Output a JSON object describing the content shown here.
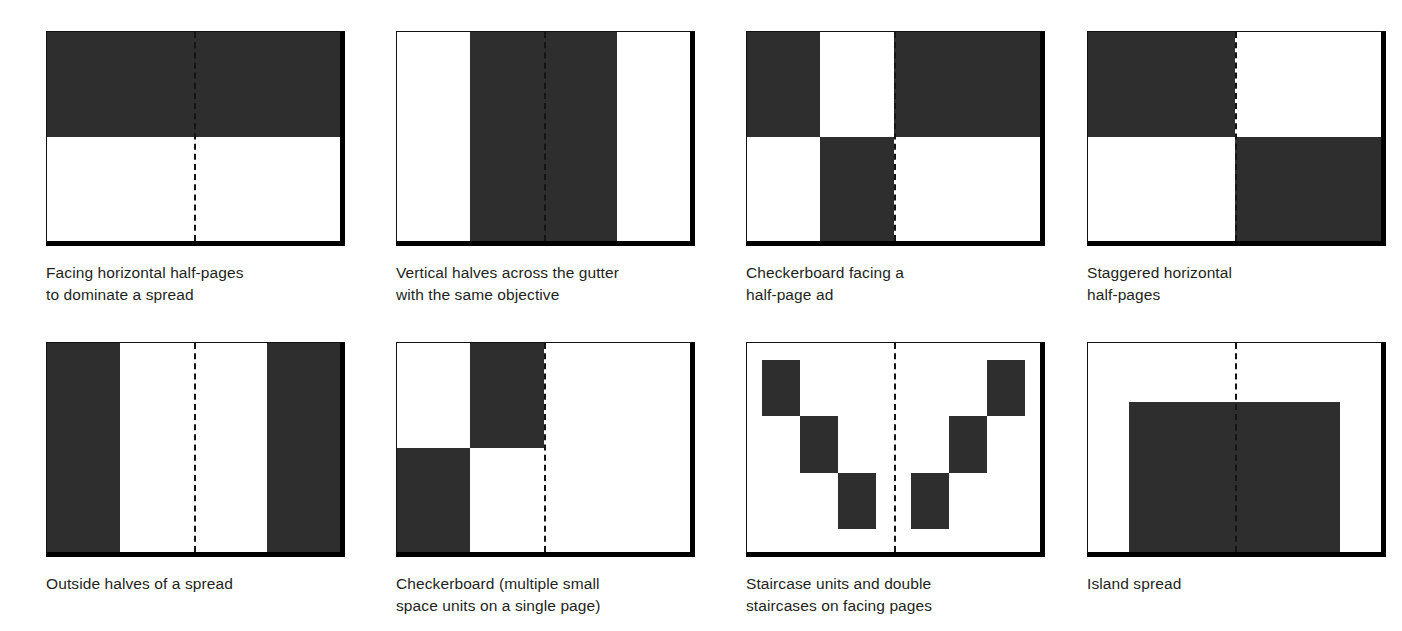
{
  "figure": {
    "fill_color": "#2e2e2e",
    "frame_color": "#000000",
    "page_color": "#ffffff",
    "caption_color": "#231f20"
  },
  "panels": [
    {
      "id": "facing-horizontal-half-pages",
      "caption": "Facing horizontal half-pages\nto dominate a spread",
      "frame": {
        "x": 46,
        "y": 31,
        "w": 299,
        "h": 215
      },
      "gutter_pct": 50,
      "blocks": [
        {
          "x_pct": 0,
          "y_pct": 0,
          "w_pct": 100,
          "h_pct": 50
        }
      ]
    },
    {
      "id": "vertical-halves-across-gutter",
      "caption": "Vertical halves across the gutter\nwith the same objective",
      "frame": {
        "x": 396,
        "y": 31,
        "w": 299,
        "h": 215
      },
      "gutter_pct": 50,
      "blocks": [
        {
          "x_pct": 25,
          "y_pct": 0,
          "w_pct": 50,
          "h_pct": 100
        }
      ]
    },
    {
      "id": "checkerboard-facing-half-page-ad",
      "caption": "Checkerboard facing a\nhalf-page ad",
      "frame": {
        "x": 746,
        "y": 31,
        "w": 299,
        "h": 215
      },
      "gutter_pct": 50,
      "blocks": [
        {
          "x_pct": 0,
          "y_pct": 0,
          "w_pct": 25,
          "h_pct": 50
        },
        {
          "x_pct": 25,
          "y_pct": 50,
          "w_pct": 25,
          "h_pct": 50
        },
        {
          "x_pct": 50,
          "y_pct": 0,
          "w_pct": 50,
          "h_pct": 50
        }
      ]
    },
    {
      "id": "staggered-horizontal-half-pages",
      "caption": "Staggered horizontal\nhalf-pages",
      "frame": {
        "x": 1087,
        "y": 31,
        "w": 299,
        "h": 215
      },
      "gutter_pct": 50,
      "blocks": [
        {
          "x_pct": 0,
          "y_pct": 0,
          "w_pct": 50,
          "h_pct": 50
        },
        {
          "x_pct": 50,
          "y_pct": 50,
          "w_pct": 50,
          "h_pct": 50
        }
      ]
    },
    {
      "id": "outside-halves-of-a-spread",
      "caption": "Outside halves of a spread",
      "frame": {
        "x": 46,
        "y": 342,
        "w": 299,
        "h": 215
      },
      "gutter_pct": 50,
      "blocks": [
        {
          "x_pct": 0,
          "y_pct": 0,
          "w_pct": 25,
          "h_pct": 100
        },
        {
          "x_pct": 75,
          "y_pct": 0,
          "w_pct": 25,
          "h_pct": 100
        }
      ]
    },
    {
      "id": "checkerboard-single-page",
      "caption": "Checkerboard (multiple small\nspace units on a single page)",
      "frame": {
        "x": 396,
        "y": 342,
        "w": 299,
        "h": 215
      },
      "gutter_pct": 50,
      "blocks": [
        {
          "x_pct": 25,
          "y_pct": 0,
          "w_pct": 25,
          "h_pct": 50
        },
        {
          "x_pct": 0,
          "y_pct": 50,
          "w_pct": 25,
          "h_pct": 50
        }
      ]
    },
    {
      "id": "staircase-units-double-staircases",
      "caption": "Staircase units and double\nstaircases on facing pages",
      "frame": {
        "x": 746,
        "y": 342,
        "w": 299,
        "h": 215
      },
      "gutter_pct": 50,
      "blocks": [
        {
          "x_pct": 5,
          "y_pct": 8,
          "w_pct": 13,
          "h_pct": 27
        },
        {
          "x_pct": 18,
          "y_pct": 35,
          "w_pct": 13,
          "h_pct": 27
        },
        {
          "x_pct": 31,
          "y_pct": 62,
          "w_pct": 13,
          "h_pct": 27
        },
        {
          "x_pct": 56,
          "y_pct": 62,
          "w_pct": 13,
          "h_pct": 27
        },
        {
          "x_pct": 69,
          "y_pct": 35,
          "w_pct": 13,
          "h_pct": 27
        },
        {
          "x_pct": 82,
          "y_pct": 8,
          "w_pct": 13,
          "h_pct": 27
        }
      ]
    },
    {
      "id": "island-spread",
      "caption": "Island spread",
      "frame": {
        "x": 1087,
        "y": 342,
        "w": 299,
        "h": 215
      },
      "gutter_pct": 50,
      "blocks": [
        {
          "x_pct": 14,
          "y_pct": 28,
          "w_pct": 72,
          "h_pct": 72
        }
      ]
    }
  ],
  "caption_offsets": {
    "row1_y": 256,
    "row2_y": 567
  }
}
